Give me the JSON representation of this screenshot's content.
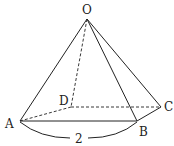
{
  "diagram": {
    "type": "geometry",
    "vertices": {
      "O": {
        "label": "O",
        "x": 87,
        "y": 19
      },
      "A": {
        "label": "A",
        "x": 20,
        "y": 121
      },
      "B": {
        "label": "B",
        "x": 137,
        "y": 121
      },
      "C": {
        "label": "C",
        "x": 161,
        "y": 107
      },
      "D": {
        "label": "D",
        "x": 71,
        "y": 107
      }
    },
    "solid_edges": [
      "OA",
      "OB",
      "OC",
      "AB",
      "BC"
    ],
    "dashed_edges": [
      "OD",
      "AD",
      "DC"
    ],
    "dimension": {
      "edge": "AB",
      "label": "2"
    },
    "colors": {
      "line": "#222222",
      "background": "#ffffff"
    }
  }
}
